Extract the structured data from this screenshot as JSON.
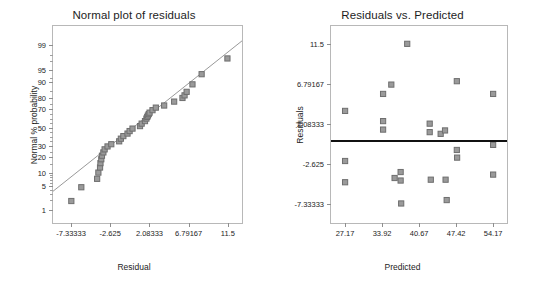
{
  "figure": {
    "background": "#ffffff",
    "marker_fill": "#9a9a9a",
    "marker_stroke": "#6e6e6e",
    "refline_color": "#8d8d8d",
    "zeroline_color": "#111111"
  },
  "chart_data": [
    {
      "type": "scatter",
      "id": "normal-plot-of-residuals",
      "title": "Normal plot of residuals",
      "xlabel": "Residual",
      "ylabel": "Normal % probability",
      "grid": false,
      "legend": null,
      "xlim": [
        -9.5,
        13.2
      ],
      "xticks": [
        "-7.33333",
        "-2.625",
        "2.08333",
        "6.79167",
        "11.5"
      ],
      "xtick_values": [
        -7.33333,
        -2.625,
        2.08333,
        6.79167,
        11.5
      ],
      "yscale": "normal-probability",
      "yticks": [
        "1",
        "5",
        "10",
        "20",
        "30",
        "50",
        "70",
        "80",
        "90",
        "95",
        "99"
      ],
      "ytick_values": [
        1,
        5,
        10,
        20,
        30,
        50,
        70,
        80,
        90,
        95,
        99
      ],
      "ylim": [
        0.35,
        99.8
      ],
      "reference_line": {
        "x1": -9.5,
        "y1": 3.6,
        "x2": 13.2,
        "y2": 99.3
      },
      "points": [
        {
          "x": -7.3,
          "y": 1.9
        },
        {
          "x": -6.1,
          "y": 4.6
        },
        {
          "x": -4.2,
          "y": 7.4
        },
        {
          "x": -4.05,
          "y": 10.2
        },
        {
          "x": -3.85,
          "y": 13.0
        },
        {
          "x": -3.8,
          "y": 15.8
        },
        {
          "x": -3.7,
          "y": 18.6
        },
        {
          "x": -3.62,
          "y": 21.4
        },
        {
          "x": -3.45,
          "y": 24.2
        },
        {
          "x": -3.3,
          "y": 27.0
        },
        {
          "x": -2.95,
          "y": 29.8
        },
        {
          "x": -2.5,
          "y": 32.0
        },
        {
          "x": -1.55,
          "y": 35.0
        },
        {
          "x": -1.35,
          "y": 37.8
        },
        {
          "x": -1.05,
          "y": 40.6
        },
        {
          "x": -0.55,
          "y": 43.4
        },
        {
          "x": -0.3,
          "y": 46.2
        },
        {
          "x": 0.05,
          "y": 49.0
        },
        {
          "x": 0.95,
          "y": 51.8
        },
        {
          "x": 1.15,
          "y": 54.6
        },
        {
          "x": 1.55,
          "y": 57.4
        },
        {
          "x": 1.72,
          "y": 60.2
        },
        {
          "x": 1.82,
          "y": 62.0
        },
        {
          "x": 1.9,
          "y": 63.5
        },
        {
          "x": 2.0,
          "y": 65.0
        },
        {
          "x": 2.1,
          "y": 66.5
        },
        {
          "x": 2.45,
          "y": 69.0
        },
        {
          "x": 2.85,
          "y": 71.5
        },
        {
          "x": 3.85,
          "y": 73.5
        },
        {
          "x": 5.05,
          "y": 77.0
        },
        {
          "x": 6.05,
          "y": 80.0
        },
        {
          "x": 6.3,
          "y": 82.0
        },
        {
          "x": 6.55,
          "y": 84.5
        },
        {
          "x": 7.25,
          "y": 89.0
        },
        {
          "x": 8.35,
          "y": 93.5
        },
        {
          "x": 11.45,
          "y": 97.5
        }
      ]
    },
    {
      "type": "scatter",
      "id": "residuals-vs-predicted",
      "title": "Residuals vs. Predicted",
      "xlabel": "Predicted",
      "ylabel": "Residuals",
      "grid": false,
      "legend": null,
      "xlim": [
        24.6,
        56.7
      ],
      "xticks": [
        "27.17",
        "33.92",
        "40.67",
        "47.42",
        "54.17"
      ],
      "xtick_values": [
        27.17,
        33.92,
        40.67,
        47.42,
        54.17
      ],
      "yticks": [
        "11.5",
        "6.79167",
        "2.08333",
        "-2.625",
        "-7.33333"
      ],
      "ytick_values": [
        11.5,
        6.79167,
        2.08333,
        -2.625,
        -7.33333
      ],
      "ylim": [
        -9.6,
        13.6
      ],
      "zero_line": {
        "y": 0.0,
        "style": "thick-solid"
      },
      "points": [
        {
          "x": 27.17,
          "y": 3.6
        },
        {
          "x": 27.17,
          "y": -2.3
        },
        {
          "x": 27.17,
          "y": -4.8
        },
        {
          "x": 34.1,
          "y": 5.6
        },
        {
          "x": 34.1,
          "y": 2.4
        },
        {
          "x": 34.1,
          "y": 1.4
        },
        {
          "x": 35.6,
          "y": 6.7
        },
        {
          "x": 36.2,
          "y": -4.3
        },
        {
          "x": 37.3,
          "y": -3.6
        },
        {
          "x": 37.3,
          "y": -4.6
        },
        {
          "x": 37.4,
          "y": -7.3
        },
        {
          "x": 38.5,
          "y": 11.5
        },
        {
          "x": 42.6,
          "y": 2.1
        },
        {
          "x": 42.6,
          "y": 1.1
        },
        {
          "x": 42.8,
          "y": -4.5
        },
        {
          "x": 44.6,
          "y": 0.9
        },
        {
          "x": 45.4,
          "y": 1.3
        },
        {
          "x": 45.5,
          "y": -4.5
        },
        {
          "x": 45.7,
          "y": -6.9
        },
        {
          "x": 47.55,
          "y": 7.1
        },
        {
          "x": 47.55,
          "y": -1.0
        },
        {
          "x": 47.6,
          "y": -1.9
        },
        {
          "x": 54.17,
          "y": 5.6
        },
        {
          "x": 54.17,
          "y": -0.4
        },
        {
          "x": 54.17,
          "y": -3.9
        }
      ]
    }
  ]
}
